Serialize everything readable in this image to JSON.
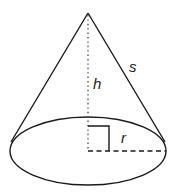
{
  "diagram": {
    "labels": {
      "slant_height": "s",
      "height": "h",
      "radius": "r"
    },
    "colors": {
      "stroke": "#1a1a1a",
      "background": "#ffffff"
    },
    "geometry": {
      "apex": [
        88,
        13
      ],
      "base_center": [
        88,
        151
      ],
      "base_rx": 78,
      "base_ry": 34
    }
  }
}
